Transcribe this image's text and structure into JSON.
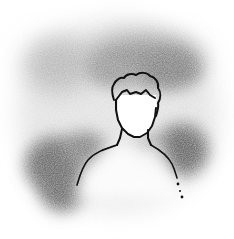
{
  "image": {
    "description": "Grayscale illustration of a head-and-shoulders silhouette outline surrounded by soft blurred gray patches",
    "colors": {
      "background": "#ffffff",
      "outline": "#111111",
      "blob_dark": "#5a5a5a",
      "blob_mid": "#8a8a8a",
      "blob_light": "#b5b5b5"
    },
    "elements": [
      "gray-haze-blobs",
      "person-silhouette-outline"
    ]
  }
}
